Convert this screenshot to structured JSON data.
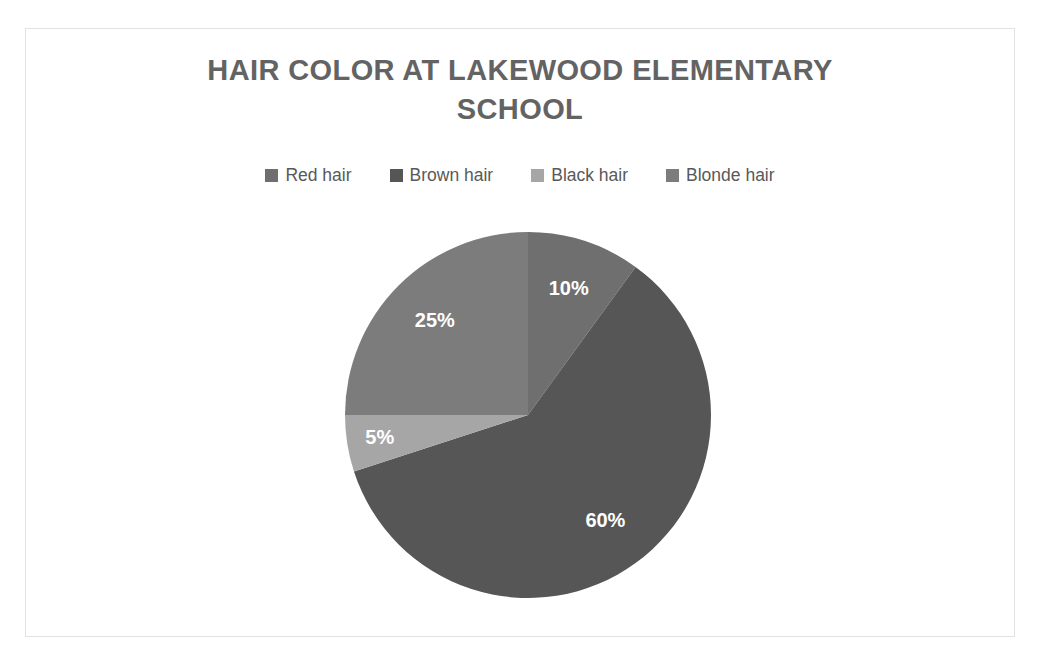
{
  "chart_data": {
    "type": "pie",
    "title": "HAIR COLOR AT LAKEWOOD ELEMENTARY SCHOOL",
    "categories": [
      "Red hair",
      "Brown hair",
      "Black hair",
      "Blonde hair"
    ],
    "values": [
      10,
      60,
      5,
      25
    ],
    "value_labels": [
      "10%",
      "60%",
      "5%",
      "25%"
    ],
    "colors": [
      "#6f6f6f",
      "#565656",
      "#a6a6a6",
      "#7c7c7c"
    ],
    "legend_position": "top",
    "start_angle_deg": 0,
    "direction": "clockwise",
    "grid": false,
    "xlabel": "",
    "ylabel": ""
  },
  "title": {
    "line1": "HAIR COLOR AT LAKEWOOD ELEMENTARY",
    "line2": "SCHOOL",
    "color": "#636363"
  },
  "legend": {
    "items": [
      {
        "label": "Red hair",
        "color": "#6f6f6f"
      },
      {
        "label": "Brown hair",
        "color": "#565656"
      },
      {
        "label": "Black hair",
        "color": "#a6a6a6"
      },
      {
        "label": "Blonde hair",
        "color": "#7c7c7c"
      }
    ]
  },
  "slices": [
    {
      "name": "Red hair",
      "label": "10%",
      "color": "#6f6f6f",
      "value": 10
    },
    {
      "name": "Brown hair",
      "label": "60%",
      "color": "#565656",
      "value": 60
    },
    {
      "name": "Black hair",
      "label": "5%",
      "color": "#a6a6a6",
      "value": 5
    },
    {
      "name": "Blonde hair",
      "label": "25%",
      "color": "#7c7c7c",
      "value": 25
    }
  ],
  "geometry": {
    "cx": 502,
    "cy": 386,
    "r": 183,
    "label_radius_factor": 0.72
  },
  "frame": {
    "border_color": "#e2e2e2",
    "background": "#ffffff"
  }
}
